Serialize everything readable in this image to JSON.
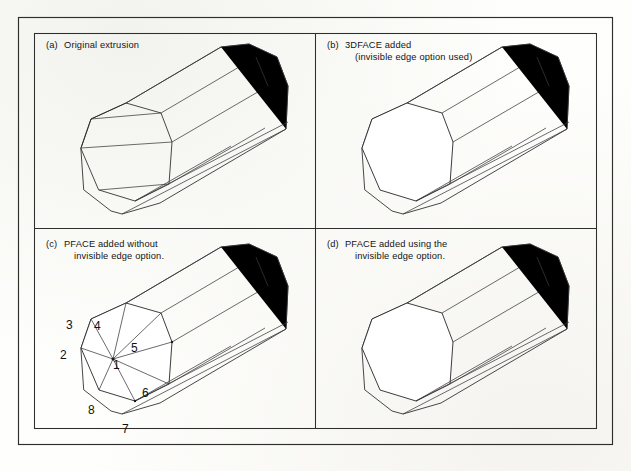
{
  "figure": {
    "background_color": "#fefefc",
    "line_color": "#27272a",
    "panel_count": 4
  },
  "panels": [
    {
      "id": "a",
      "marker": "(a)",
      "caption_lines": [
        "Original extrusion"
      ],
      "capped": false,
      "has_vertex_numbers": false
    },
    {
      "id": "b",
      "marker": "(b)",
      "caption_lines": [
        "3DFACE added",
        "(invisible edge option used)"
      ],
      "capped": true,
      "has_vertex_numbers": false
    },
    {
      "id": "c",
      "marker": "(c)",
      "caption_lines": [
        "PFACE added without",
        "invisible edge option."
      ],
      "capped": true,
      "has_vertex_numbers": true
    },
    {
      "id": "d",
      "marker": "(d)",
      "caption_lines": [
        "PFACE added using the",
        "invisible edge option."
      ],
      "capped": true,
      "has_vertex_numbers": false
    }
  ],
  "vertex_numbers": [
    {
      "label": "1",
      "x": 113,
      "y": 369,
      "role": "fan-center"
    },
    {
      "label": "2",
      "x": 60,
      "y": 359,
      "role": "perimeter"
    },
    {
      "label": "3",
      "x": 66,
      "y": 329,
      "role": "perimeter"
    },
    {
      "label": "4",
      "x": 94,
      "y": 330,
      "role": "perimeter"
    },
    {
      "label": "5",
      "x": 131,
      "y": 352,
      "role": "perimeter"
    },
    {
      "label": "6",
      "x": 142,
      "y": 397,
      "role": "perimeter"
    },
    {
      "label": "7",
      "x": 122,
      "y": 433,
      "role": "perimeter"
    },
    {
      "label": "8",
      "x": 88,
      "y": 414,
      "role": "perimeter"
    }
  ]
}
